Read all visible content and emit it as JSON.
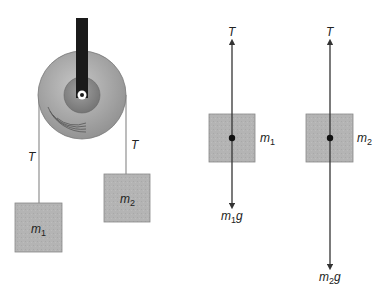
{
  "diagram": {
    "type": "atwood-machine-free-body",
    "colors": {
      "block_fill": "#b4b4b4",
      "block_stroke": "#888888",
      "rope": "#999999",
      "bracket": "#1a1a1a",
      "pulley_outer": "#a9a9a9",
      "pulley_hub": "#8a8a8a",
      "arrow": "#333333"
    },
    "pulley_system": {
      "rope_left_label": "T",
      "rope_right_label": "T",
      "block_left": {
        "mass": "m",
        "sub": "1"
      },
      "block_right": {
        "mass": "m",
        "sub": "2"
      }
    },
    "free_body_1": {
      "up_force": "T",
      "mass_label": {
        "mass": "m",
        "sub": "1"
      },
      "down_force": {
        "mass": "m",
        "sub": "1",
        "g": "g"
      }
    },
    "free_body_2": {
      "up_force": "T",
      "mass_label": {
        "mass": "m",
        "sub": "2"
      },
      "down_force": {
        "mass": "m",
        "sub": "2",
        "g": "g"
      }
    }
  }
}
